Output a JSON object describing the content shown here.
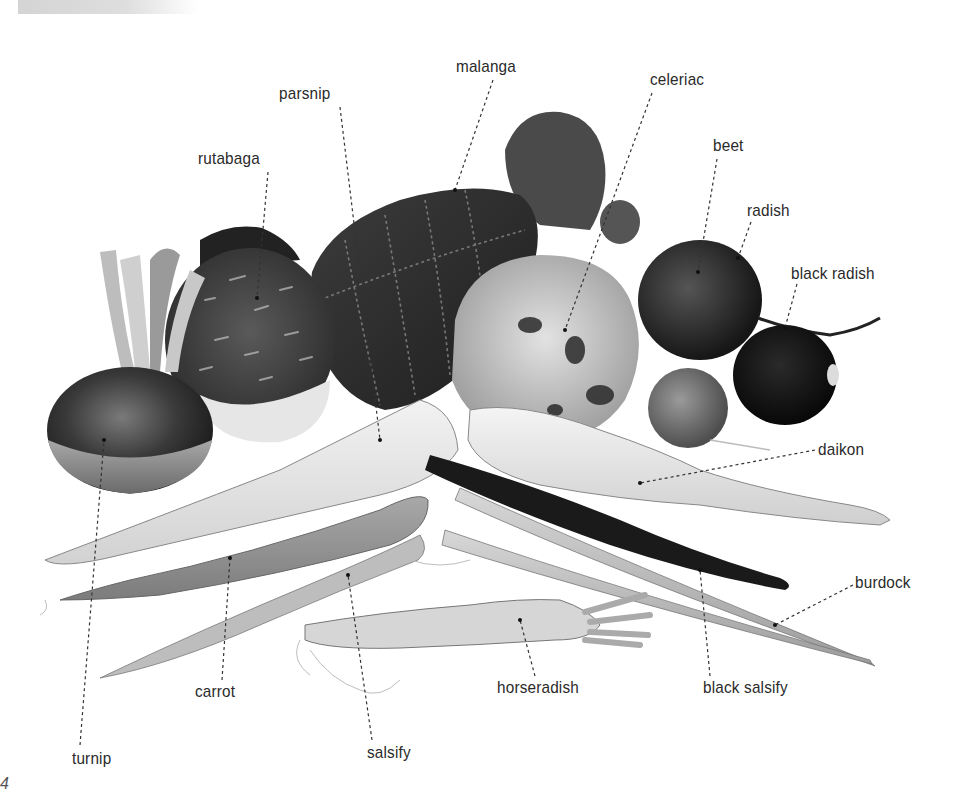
{
  "page": {
    "page_number": "4",
    "figure_description": "Illustration of root vegetables with labels"
  },
  "labels": [
    {
      "name": "malanga",
      "x": 456,
      "y": 57
    },
    {
      "name": "parsnip",
      "x": 279,
      "y": 84
    },
    {
      "name": "celeriac",
      "x": 650,
      "y": 70
    },
    {
      "name": "rutabaga",
      "x": 198,
      "y": 149
    },
    {
      "name": "beet",
      "x": 713,
      "y": 136
    },
    {
      "name": "radish",
      "x": 747,
      "y": 201
    },
    {
      "name": "black radish",
      "x": 791,
      "y": 264
    },
    {
      "name": "daikon",
      "x": 818,
      "y": 440
    },
    {
      "name": "burdock",
      "x": 855,
      "y": 573
    },
    {
      "name": "carrot",
      "x": 195,
      "y": 682
    },
    {
      "name": "horseradish",
      "x": 497,
      "y": 678
    },
    {
      "name": "black salsify",
      "x": 703,
      "y": 678
    },
    {
      "name": "turnip",
      "x": 72,
      "y": 749
    },
    {
      "name": "salsify",
      "x": 367,
      "y": 743
    }
  ]
}
